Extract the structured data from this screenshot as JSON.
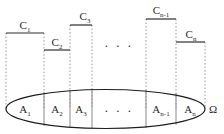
{
  "figure": {
    "width": 224,
    "height": 134,
    "background_color": "#ffffff"
  },
  "style": {
    "bar_color": "#2f2f2f",
    "dashed_color": "#9a9a9a",
    "ellipse_color": "#1e1e1e",
    "partition_color": "#8a8a8a",
    "text_color": "#2b2b2b"
  },
  "top_bars": [
    {
      "id": "bar-c1",
      "base": "C",
      "subscript": "1",
      "label": "C₁",
      "x_start": 6,
      "x_end": 44,
      "y": 33,
      "label_x": 25,
      "label_y": 29
    },
    {
      "id": "bar-c2",
      "base": "C",
      "subscript": "2",
      "label": "C₂",
      "x_start": 44,
      "x_end": 70,
      "y": 50,
      "label_x": 57,
      "label_y": 46
    },
    {
      "id": "bar-c3",
      "base": "C",
      "subscript": "3",
      "label": "C₃",
      "x_start": 70,
      "x_end": 92,
      "y": 25,
      "label_x": 85,
      "label_y": 20
    },
    {
      "id": "bar-cn-1",
      "base": "C",
      "subscript": "n-1",
      "label": "Cₙ₋₁",
      "x_start": 146,
      "x_end": 176,
      "y": 19,
      "label_x": 161,
      "label_y": 14
    },
    {
      "id": "bar-cn",
      "base": "C",
      "subscript": "n",
      "label": "Cₙ",
      "x_start": 176,
      "x_end": 205,
      "y": 42,
      "label_x": 191,
      "label_y": 38
    }
  ],
  "drop_lines": [
    {
      "id": "drop-1",
      "x": 6,
      "y_top": 33,
      "y_bottom": 109
    },
    {
      "id": "drop-2",
      "x": 44,
      "y_top": 33,
      "y_bottom": 109
    },
    {
      "id": "drop-3",
      "x": 70,
      "y_top": 25,
      "y_bottom": 109
    },
    {
      "id": "drop-4",
      "x": 92,
      "y_top": 25,
      "y_bottom": 109
    },
    {
      "id": "drop-5",
      "x": 146,
      "y_top": 19,
      "y_bottom": 109
    },
    {
      "id": "drop-6",
      "x": 176,
      "y_top": 19,
      "y_bottom": 109
    },
    {
      "id": "drop-7",
      "x": 205,
      "y_top": 42,
      "y_bottom": 109
    }
  ],
  "middle_dots": {
    "id": "top-ellipsis",
    "text": ". . .",
    "x": 119,
    "y": 47
  },
  "ellipse": {
    "id": "sample-space-ellipse",
    "center_x": 105.5,
    "center_y": 109,
    "radius_x": 99.5,
    "radius_y": 19.5
  },
  "partitions": [
    {
      "id": "partition-1",
      "x": 44,
      "y_top": 92.0,
      "y_bottom": 126.0
    },
    {
      "id": "partition-2",
      "x": 70,
      "y_top": 90.3,
      "y_bottom": 127.7
    },
    {
      "id": "partition-3",
      "x": 92,
      "y_top": 89.6,
      "y_bottom": 128.4
    },
    {
      "id": "partition-4",
      "x": 146,
      "y_top": 90.0,
      "y_bottom": 128.0
    },
    {
      "id": "partition-5",
      "x": 176,
      "y_top": 93.2,
      "y_bottom": 124.8
    }
  ],
  "set_labels": [
    {
      "id": "set-a1",
      "base": "A",
      "subscript": "1",
      "label": "A₁",
      "x": 25,
      "y": 113
    },
    {
      "id": "set-a2",
      "base": "A",
      "subscript": "2",
      "label": "A₂",
      "x": 57,
      "y": 113
    },
    {
      "id": "set-a3",
      "base": "A",
      "subscript": "3",
      "label": "A₃",
      "x": 81,
      "y": 113
    },
    {
      "id": "set-an-1",
      "base": "A",
      "subscript": "n-1",
      "label": "Aₙ₋₁",
      "x": 161,
      "y": 113
    },
    {
      "id": "set-an",
      "base": "A",
      "subscript": "n",
      "label": "Aₙ",
      "x": 190,
      "y": 113
    }
  ],
  "ellipse_dots": {
    "id": "ellipse-ellipsis",
    "text": ". . .",
    "x": 119,
    "y": 112
  },
  "omega": {
    "id": "omega-symbol",
    "text": "Ω",
    "x": 213,
    "y": 113
  }
}
